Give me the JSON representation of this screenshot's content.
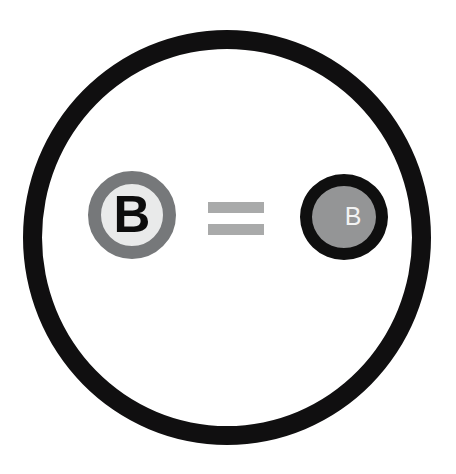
{
  "figure": {
    "background_color": "#ffffff",
    "canvas": {
      "width": 456,
      "height": 474
    }
  },
  "outer_ring": {
    "name": "enclosing-circle",
    "color": "#100f10",
    "stroke_px": 19,
    "bounds": {
      "x": 23,
      "y": 30,
      "width": 408,
      "height": 415
    }
  },
  "left_token": {
    "label": "B",
    "ring_color": "#76787a",
    "fill_color": "#e9eaea",
    "text_color": "#0d0d0d",
    "font_weight": "bold",
    "diameter": 88,
    "center": {
      "x": 132,
      "y": 215
    }
  },
  "operator": {
    "symbol": "=",
    "name": "equals-sign",
    "color": "#a9aaaa",
    "bar_count": 2,
    "bar_width": 56,
    "bar_height": 11,
    "center": {
      "x": 236,
      "y": 218
    }
  },
  "right_token": {
    "label": "B",
    "ring_color": "#0f0f0f",
    "fill_color": "#949596",
    "text_color": "#f2f3f3",
    "font_weight": "normal",
    "diameter": 88,
    "center": {
      "x": 344,
      "y": 217
    }
  }
}
